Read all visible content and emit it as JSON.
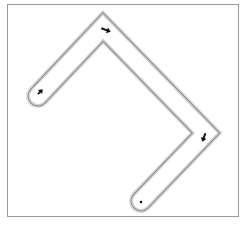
{
  "diagram": {
    "type": "bent-corridor-path",
    "frame": {
      "x": 7,
      "y": 4,
      "width": 232,
      "height": 213,
      "stroke": "#9a9a9a"
    },
    "corridor": {
      "centerline": [
        [
          38,
          96
        ],
        [
          103,
          27
        ],
        [
          206,
          133
        ],
        [
          141,
          201
        ]
      ],
      "width": 20,
      "outer_stroke": "#8c8c8c",
      "inner_fill": "#ffffff",
      "shadow": "#d8d8d8"
    },
    "markers": [
      {
        "name": "start-arrow",
        "icon": "arrow-up-right-icon",
        "x": 40,
        "y": 92,
        "angle": -45
      },
      {
        "name": "top-corner-arrow",
        "icon": "arrow-right-icon",
        "x": 106,
        "y": 30,
        "angle": 20
      },
      {
        "name": "right-corner-arrow",
        "icon": "arrow-down-left-icon",
        "x": 204,
        "y": 137,
        "angle": 110
      },
      {
        "name": "end-dot",
        "icon": "dot-icon",
        "x": 141,
        "y": 202
      }
    ],
    "marker_color": "#111111"
  }
}
